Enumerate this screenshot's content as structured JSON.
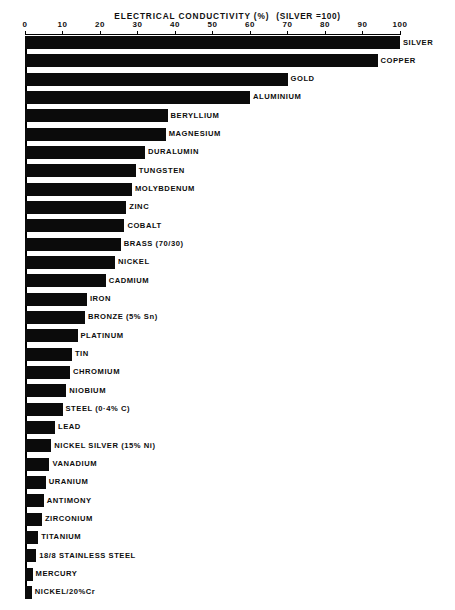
{
  "chart_data": {
    "type": "bar",
    "orientation": "horizontal",
    "title_parts": {
      "main": "ELECTRICAL  CONDUCTIVITY  (%)",
      "reference": "(SILVER =100)"
    },
    "xlabel": "",
    "ylabel": "",
    "xlim": [
      0,
      100
    ],
    "grid": false,
    "legend": false,
    "axis_position": "top",
    "tick_labels": [
      "0",
      "10",
      "20",
      "30",
      "40",
      "50",
      "60",
      "70",
      "80",
      "90",
      "100"
    ],
    "ticks": [
      0,
      10,
      20,
      30,
      40,
      50,
      60,
      70,
      80,
      90,
      100
    ],
    "categories": [
      "SILVER",
      "COPPER",
      "GOLD",
      "ALUMINIUM",
      "BERYLLIUM",
      "MAGNESIUM",
      "DURALUMIN",
      "TUNGSTEN",
      "MOLYBDENUM",
      "ZINC",
      "COBALT",
      "BRASS (70/30)",
      "NICKEL",
      "CADMIUM",
      "IRON",
      "BRONZE (5% Sn)",
      "PLATINUM",
      "TIN",
      "CHROMIUM",
      "NIOBIUM",
      "STEEL (0·4% C)",
      "LEAD",
      "NICKEL SILVER (15% Ni)",
      "VANADIUM",
      "URANIUM",
      "ANTIMONY",
      "ZIRCONIUM",
      "TITANIUM",
      "18/8 STAINLESS STEEL",
      "MERCURY",
      "NICKEL/20%Cr"
    ],
    "values": [
      100,
      94,
      70,
      60,
      38,
      37.5,
      32,
      29.5,
      28.5,
      27,
      26.5,
      25.5,
      24,
      21.5,
      16.5,
      16,
      14,
      12.5,
      12,
      11,
      10,
      8,
      7,
      6.5,
      5.5,
      5,
      4.5,
      3.5,
      3,
      2,
      1.8
    ]
  }
}
